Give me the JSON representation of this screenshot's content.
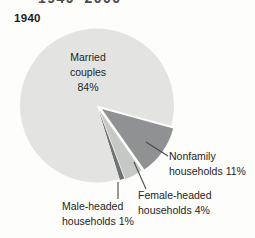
{
  "figure": {
    "clipped_top_title": "1940–2000",
    "year_label": "1940"
  },
  "chart_data": {
    "type": "pie",
    "title": "1940",
    "legend_position": "none",
    "label_style": "callout-leader-lines",
    "slices": [
      {
        "label": "Married couples",
        "value_pct": 84,
        "display": "Married\ncouples\n84%",
        "color": "#e3e4e1"
      },
      {
        "label": "Nonfamily households",
        "value_pct": 11,
        "display": "Nonfamily\nhouseholds 11%",
        "color": "#8f9192"
      },
      {
        "label": "Female-headed households",
        "value_pct": 4,
        "display": "Female-headed\nhouseholds 4%",
        "color": "#c6c8c5"
      },
      {
        "label": "Male-headed households",
        "value_pct": 1,
        "display": "Male-headed\nhouseholds 1%",
        "color": "#6f7173"
      }
    ]
  }
}
